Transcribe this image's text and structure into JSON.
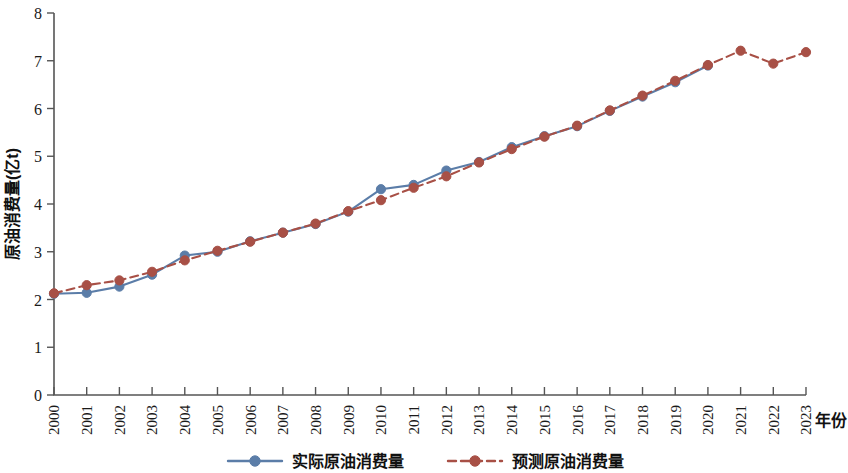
{
  "chart_data": {
    "type": "line",
    "title": "",
    "xlabel": "年份",
    "ylabel": "原油消费量(亿t)",
    "xlim": [
      2000,
      2023
    ],
    "ylim": [
      0,
      8
    ],
    "yticks": [
      0,
      1,
      2,
      3,
      4,
      5,
      6,
      7,
      8
    ],
    "grid": false,
    "legend_position": "bottom-center",
    "categories": [
      "2000",
      "2001",
      "2002",
      "2003",
      "2004",
      "2005",
      "2006",
      "2007",
      "2008",
      "2009",
      "2010",
      "2011",
      "2012",
      "2013",
      "2014",
      "2015",
      "2016",
      "2017",
      "2018",
      "2019",
      "2020",
      "2021",
      "2022",
      "2023"
    ],
    "series": [
      {
        "name": "实际原油消费量",
        "style": "solid",
        "color": "#5b7da8",
        "marker": "circle",
        "values": [
          2.12,
          2.14,
          2.27,
          2.52,
          2.92,
          3.0,
          3.22,
          3.4,
          3.58,
          3.84,
          4.31,
          4.4,
          4.7,
          4.88,
          5.19,
          5.42,
          5.63,
          5.95,
          6.25,
          6.55,
          6.9,
          null,
          null,
          null
        ]
      },
      {
        "name": "预测原油消费量",
        "style": "dashed",
        "color": "#a85046",
        "marker": "circle",
        "values": [
          2.13,
          2.3,
          2.4,
          2.58,
          2.82,
          3.02,
          3.21,
          3.4,
          3.59,
          3.85,
          4.08,
          4.34,
          4.58,
          4.87,
          5.15,
          5.41,
          5.64,
          5.96,
          6.27,
          6.58,
          6.91,
          7.21,
          6.94,
          7.18
        ]
      }
    ]
  },
  "legend": {
    "entries": [
      {
        "label": "实际原油消费量",
        "color": "#5b7da8",
        "style": "solid"
      },
      {
        "label": "预测原油消费量",
        "color": "#a85046",
        "style": "dashed"
      }
    ]
  },
  "colors": {
    "actual": "#5b7da8",
    "forecast": "#a85046",
    "axis": "#555555",
    "text": "#111111",
    "background": "#ffffff"
  }
}
